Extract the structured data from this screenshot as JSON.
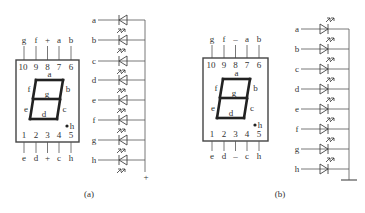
{
  "panels": [
    {
      "caption": "(a)",
      "type": "common-anode",
      "top_pins": {
        "labels": [
          "g",
          "f",
          "+",
          "a",
          "b"
        ],
        "numbers": [
          "10",
          "9",
          "8",
          "7",
          "6"
        ]
      },
      "bottom_pins": {
        "numbers": [
          "1",
          "2",
          "3",
          "4",
          "5"
        ],
        "labels": [
          "e",
          "d",
          "+",
          "c",
          "h"
        ]
      },
      "segments": {
        "a": "a",
        "b": "b",
        "c": "c",
        "d": "d",
        "e": "e",
        "f": "f",
        "g": "g",
        "dp": "h"
      },
      "led_rows": [
        "a",
        "b",
        "c",
        "d",
        "e",
        "f",
        "g",
        "h"
      ],
      "bus_terminal": "+"
    },
    {
      "caption": "(b)",
      "type": "common-cathode",
      "top_pins": {
        "labels": [
          "g",
          "f",
          "–",
          "a",
          "b"
        ],
        "numbers": [
          "10",
          "9",
          "8",
          "7",
          "6"
        ]
      },
      "bottom_pins": {
        "numbers": [
          "1",
          "2",
          "3",
          "4",
          "5"
        ],
        "labels": [
          "e",
          "d",
          "–",
          "c",
          "h"
        ]
      },
      "segments": {
        "a": "a",
        "b": "b",
        "c": "c",
        "d": "d",
        "e": "e",
        "f": "f",
        "g": "g",
        "dp": "h"
      },
      "led_rows": [
        "a",
        "b",
        "c",
        "d",
        "e",
        "f",
        "g",
        "h"
      ],
      "bus_terminal": "ground-symbol"
    }
  ]
}
